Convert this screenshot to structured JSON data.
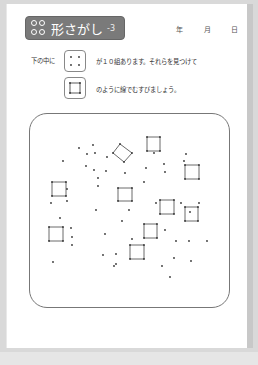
{
  "header": {
    "title": "形さがし",
    "number": "-3",
    "title_icon": "clover-icon",
    "date_labels": [
      "年",
      "月",
      "日"
    ]
  },
  "instructions": {
    "line1_prefix": "下の中に",
    "line1_suffix": "が１０組あります。それらを見つけて",
    "line2_suffix": "のように線でむすびましょう。",
    "furigana": {
      "下": "した",
      "中": "なか",
      "組": "くみ",
      "見": "み",
      "線": "せん"
    }
  },
  "example_dots": {
    "shape": "4-dot square",
    "dots": [
      [
        6,
        6
      ],
      [
        14,
        6
      ],
      [
        6,
        14
      ],
      [
        14,
        14
      ]
    ]
  },
  "example_connected": {
    "shape": "connected square"
  },
  "puzzle": {
    "target_count": 10,
    "squares": [
      [
        [
          147,
          137
        ],
        [
          160,
          137
        ],
        [
          160,
          151
        ],
        [
          147,
          151
        ]
      ],
      [
        [
          113,
          153
        ],
        [
          120,
          144
        ],
        [
          132,
          153
        ],
        [
          124,
          162
        ]
      ],
      [
        [
          185,
          165
        ],
        [
          199,
          165
        ],
        [
          199,
          179
        ],
        [
          185,
          179
        ]
      ],
      [
        [
          52,
          182
        ],
        [
          66,
          182
        ],
        [
          66,
          196
        ],
        [
          52,
          196
        ]
      ],
      [
        [
          118,
          188
        ],
        [
          132,
          188
        ],
        [
          132,
          201
        ],
        [
          118,
          201
        ]
      ],
      [
        [
          160,
          200
        ],
        [
          174,
          200
        ],
        [
          174,
          214
        ],
        [
          160,
          214
        ]
      ],
      [
        [
          185,
          207
        ],
        [
          198,
          207
        ],
        [
          198,
          221
        ],
        [
          185,
          221
        ]
      ],
      [
        [
          49,
          227
        ],
        [
          63,
          227
        ],
        [
          63,
          241
        ],
        [
          49,
          241
        ]
      ],
      [
        [
          144,
          224
        ],
        [
          157,
          224
        ],
        [
          157,
          238
        ],
        [
          144,
          238
        ]
      ],
      [
        [
          130,
          245
        ],
        [
          144,
          245
        ],
        [
          144,
          259
        ],
        [
          130,
          259
        ]
      ]
    ],
    "dots": [
      [
        79,
        148
      ],
      [
        93,
        145
      ],
      [
        63,
        161
      ],
      [
        87,
        154
      ],
      [
        95,
        153
      ],
      [
        107,
        157
      ],
      [
        86,
        166
      ],
      [
        94,
        170
      ],
      [
        106,
        171
      ],
      [
        98,
        178
      ],
      [
        98,
        186
      ],
      [
        154,
        153
      ],
      [
        186,
        154
      ],
      [
        184,
        161
      ],
      [
        164,
        164
      ],
      [
        165,
        172
      ],
      [
        146,
        168
      ],
      [
        144,
        182
      ],
      [
        125,
        173
      ],
      [
        67,
        189
      ],
      [
        67,
        201
      ],
      [
        51,
        203
      ],
      [
        96,
        210
      ],
      [
        129,
        210
      ],
      [
        156,
        203
      ],
      [
        181,
        203
      ],
      [
        199,
        203
      ],
      [
        190,
        212
      ],
      [
        60,
        218
      ],
      [
        122,
        221
      ],
      [
        71,
        228
      ],
      [
        72,
        237
      ],
      [
        72,
        245
      ],
      [
        105,
        234
      ],
      [
        132,
        239
      ],
      [
        165,
        230
      ],
      [
        176,
        241
      ],
      [
        189,
        241
      ],
      [
        207,
        241
      ],
      [
        116,
        254
      ],
      [
        103,
        255
      ],
      [
        116,
        264
      ],
      [
        174,
        258
      ],
      [
        191,
        261
      ],
      [
        53,
        262
      ],
      [
        114,
        266
      ],
      [
        162,
        266
      ],
      [
        170,
        277
      ]
    ]
  }
}
